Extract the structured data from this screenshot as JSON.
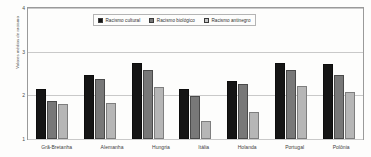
{
  "chart_data": {
    "type": "bar",
    "title": "",
    "subtitle": "",
    "xlabel": "",
    "ylabel": "Valores médios de racismo",
    "ylim": [
      1,
      4
    ],
    "yticks": [
      1,
      2,
      3,
      4
    ],
    "ytick_labels": [
      "1",
      "2",
      "3",
      "4"
    ],
    "grid": true,
    "legend_position": "top-center",
    "categories": [
      "Grã-Bretanha",
      "Alemanha",
      "Hungria",
      "Itália",
      "Holanda",
      "Portugal",
      "Polônia"
    ],
    "series": [
      {
        "name": "Racismo cultural",
        "color": "#151515",
        "values": [
          2.15,
          2.47,
          2.75,
          2.14,
          2.33,
          2.74,
          2.72
        ]
      },
      {
        "name": "Racismo biológico",
        "color": "#787878",
        "values": [
          1.88,
          2.38,
          2.57,
          1.98,
          2.27,
          2.58,
          2.46
        ]
      },
      {
        "name": "Racismo antinegro",
        "color": "#b6b6b6",
        "values": [
          1.8,
          1.83,
          2.18,
          1.42,
          1.62,
          2.21,
          2.08
        ]
      }
    ]
  },
  "legend": {
    "items": [
      {
        "label": "Racismo cultural",
        "icon": "legend-swatch-icon"
      },
      {
        "label": "Racismo biológico",
        "icon": "legend-swatch-icon"
      },
      {
        "label": "Racismo antinegro",
        "icon": "legend-swatch-icon"
      }
    ]
  },
  "colors": {
    "series_cultural": "#151515",
    "series_biologico": "#787878",
    "series_antinegro": "#b6b6b6",
    "gridline": "#c9c9c9",
    "axis": "#9a9a9a",
    "background": "#fdfdfc"
  }
}
